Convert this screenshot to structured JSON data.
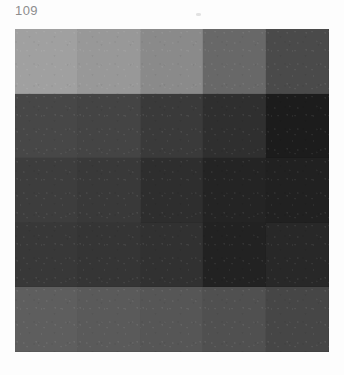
{
  "page": {
    "number": "109",
    "background_color": "#fdfdfd",
    "number_color": "#8d8d8d"
  },
  "chart_data": {
    "type": "heatmap",
    "title": "",
    "subtitle": "",
    "xlabel": "",
    "ylabel": "",
    "grid": true,
    "legend": "none",
    "columns": [
      "1",
      "2",
      "3",
      "4",
      "5"
    ],
    "rows": [
      "1",
      "2",
      "3",
      "4",
      "5"
    ],
    "value_unit": "8-bit gray level",
    "series": [
      {
        "name": "Row 1",
        "values": [
          160,
          152,
          138,
          104,
          74
        ]
      },
      {
        "name": "Row 2",
        "values": [
          71,
          68,
          58,
          47,
          28
        ]
      },
      {
        "name": "Row 3",
        "values": [
          61,
          57,
          46,
          36,
          33
        ]
      },
      {
        "name": "Row 4",
        "values": [
          56,
          53,
          49,
          34,
          40
        ]
      },
      {
        "name": "Row 5",
        "values": [
          94,
          90,
          86,
          80,
          70
        ]
      }
    ],
    "cells": [
      [
        {
          "name": "r1c1",
          "hex": "#a0a0a0",
          "gray": 160
        },
        {
          "name": "r1c2",
          "hex": "#989898",
          "gray": 152
        },
        {
          "name": "r1c3",
          "hex": "#8a8a8a",
          "gray": 138
        },
        {
          "name": "r1c4",
          "hex": "#686868",
          "gray": 104
        },
        {
          "name": "r1c5",
          "hex": "#4a4a4a",
          "gray": 74
        }
      ],
      [
        {
          "name": "r2c1",
          "hex": "#474747",
          "gray": 71
        },
        {
          "name": "r2c2",
          "hex": "#444444",
          "gray": 68
        },
        {
          "name": "r2c3",
          "hex": "#3a3a3a",
          "gray": 58
        },
        {
          "name": "r2c4",
          "hex": "#2f2f2f",
          "gray": 47
        },
        {
          "name": "r2c5",
          "hex": "#1c1c1c",
          "gray": 28
        }
      ],
      [
        {
          "name": "r3c1",
          "hex": "#3d3d3d",
          "gray": 61
        },
        {
          "name": "r3c2",
          "hex": "#393939",
          "gray": 57
        },
        {
          "name": "r3c3",
          "hex": "#2e2e2e",
          "gray": 46
        },
        {
          "name": "r3c4",
          "hex": "#242424",
          "gray": 36
        },
        {
          "name": "r3c5",
          "hex": "#212121",
          "gray": 33
        }
      ],
      [
        {
          "name": "r4c1",
          "hex": "#383838",
          "gray": 56
        },
        {
          "name": "r4c2",
          "hex": "#353535",
          "gray": 53
        },
        {
          "name": "r4c3",
          "hex": "#313131",
          "gray": 49
        },
        {
          "name": "r4c4",
          "hex": "#222222",
          "gray": 34
        },
        {
          "name": "r4c5",
          "hex": "#282828",
          "gray": 40
        }
      ],
      [
        {
          "name": "r5c1",
          "hex": "#5e5e5e",
          "gray": 94
        },
        {
          "name": "r5c2",
          "hex": "#5a5a5a",
          "gray": 90
        },
        {
          "name": "r5c3",
          "hex": "#565656",
          "gray": 86
        },
        {
          "name": "r5c4",
          "hex": "#505050",
          "gray": 80
        },
        {
          "name": "r5c5",
          "hex": "#464646",
          "gray": 70
        }
      ]
    ]
  }
}
